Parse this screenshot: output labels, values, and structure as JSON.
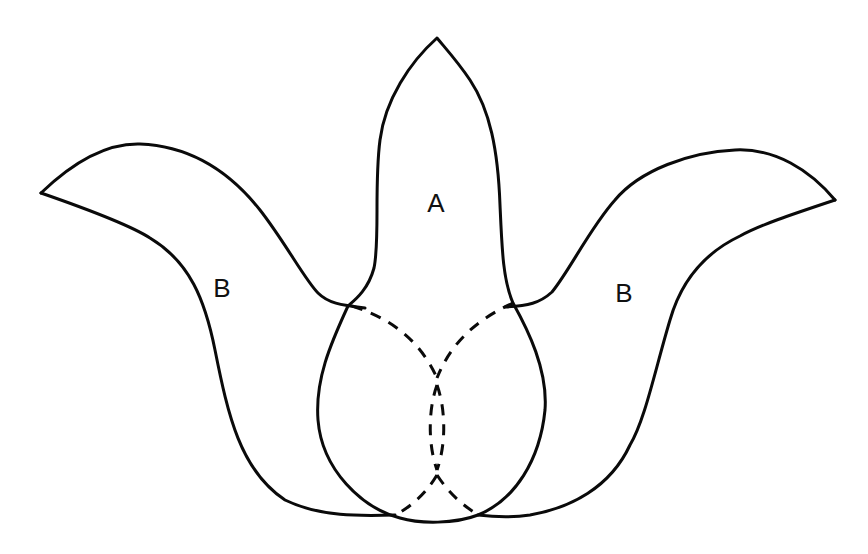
{
  "figure": {
    "type": "overlapping-petals-diagram",
    "line_color": "#0a0a0a",
    "background": "#ffffff",
    "labels": {
      "center": "A",
      "left": "B",
      "right": "B"
    },
    "shapes": [
      {
        "id": "petal-a",
        "label": "A",
        "position": "center",
        "style": "solid"
      },
      {
        "id": "petal-b-left",
        "label": "B",
        "position": "left",
        "style": "solid"
      },
      {
        "id": "petal-b-right",
        "label": "B",
        "position": "right",
        "style": "solid"
      },
      {
        "id": "hidden-edges",
        "style": "dashed"
      }
    ]
  }
}
